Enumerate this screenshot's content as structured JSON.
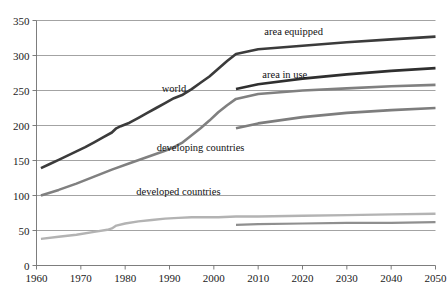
{
  "chart_data": {
    "type": "line",
    "title": "",
    "subtitle": "",
    "xlabel": "",
    "ylabel": "",
    "xlim": [
      1960,
      2050
    ],
    "ylim": [
      0,
      350
    ],
    "xticks": [
      "1960",
      "1970",
      "1980",
      "1990",
      "2000",
      "2010",
      "2020",
      "2030",
      "2040",
      "2050"
    ],
    "yticks": [
      "0",
      "50",
      "100",
      "150",
      "200",
      "250",
      "300",
      "350"
    ],
    "grid": "horizontal",
    "legend": "inline-annotations",
    "annotations": [
      {
        "text": "area equipped",
        "x": 2018,
        "y": 330
      },
      {
        "text": "area in use",
        "x": 2016,
        "y": 268
      },
      {
        "text": "world",
        "x": 1991,
        "y": 248
      },
      {
        "text": "developing countries",
        "x": 1997,
        "y": 163
      },
      {
        "text": "developed countries",
        "x": 1992,
        "y": 101
      }
    ],
    "series": [
      {
        "name": "world area equipped",
        "color": "#3b3b3b",
        "width": 2.6,
        "x": [
          1961,
          1963,
          1965,
          1967,
          1969,
          1971,
          1973,
          1975,
          1977,
          1978,
          1979,
          1981,
          1983,
          1985,
          1987,
          1989,
          1991,
          1993,
          1995,
          1997,
          1999,
          2001,
          2003,
          2005,
          2010,
          2020,
          2030,
          2040,
          2050
        ],
        "y": [
          139,
          145,
          151,
          157,
          163,
          169,
          176,
          183,
          190,
          196,
          199,
          204,
          211,
          218,
          225,
          232,
          239,
          244,
          252,
          261,
          270,
          281,
          292,
          302,
          309,
          314,
          319,
          323,
          327
        ]
      },
      {
        "name": "world area in use",
        "color": "#2f2f2f",
        "width": 2.6,
        "x": [
          2005,
          2010,
          2020,
          2030,
          2040,
          2050
        ],
        "y": [
          252,
          259,
          267,
          273,
          278,
          282
        ]
      },
      {
        "name": "developing countries area equipped",
        "color": "#808080",
        "width": 2.6,
        "x": [
          1961,
          1965,
          1969,
          1973,
          1977,
          1981,
          1985,
          1989,
          1991,
          1993,
          1995,
          1997,
          1999,
          2001,
          2003,
          2005,
          2010,
          2020,
          2030,
          2040,
          2050
        ],
        "y": [
          100,
          108,
          117,
          127,
          137,
          146,
          155,
          164,
          169,
          176,
          186,
          196,
          207,
          219,
          229,
          238,
          245,
          250,
          253,
          256,
          258
        ]
      },
      {
        "name": "developing countries area in use",
        "color": "#7d7d7d",
        "width": 2.6,
        "x": [
          2005,
          2010,
          2020,
          2030,
          2040,
          2050
        ],
        "y": [
          196,
          203,
          212,
          218,
          222,
          225
        ]
      },
      {
        "name": "developed countries area equipped",
        "color": "#b3b3b3",
        "width": 2.4,
        "x": [
          1961,
          1965,
          1969,
          1973,
          1976,
          1977,
          1978,
          1980,
          1983,
          1986,
          1989,
          1992,
          1995,
          1998,
          2001,
          2005,
          2010,
          2020,
          2030,
          2040,
          2050
        ],
        "y": [
          38,
          41,
          44,
          48,
          51,
          53,
          57,
          60,
          63,
          65,
          67,
          68,
          69,
          69,
          69,
          70,
          70,
          71,
          72,
          73,
          74
        ]
      },
      {
        "name": "developed countries area in use",
        "color": "#8f8f8f",
        "width": 2.2,
        "x": [
          2005,
          2010,
          2020,
          2030,
          2040,
          2050
        ],
        "y": [
          58,
          59,
          60,
          61,
          61,
          62
        ]
      }
    ]
  }
}
